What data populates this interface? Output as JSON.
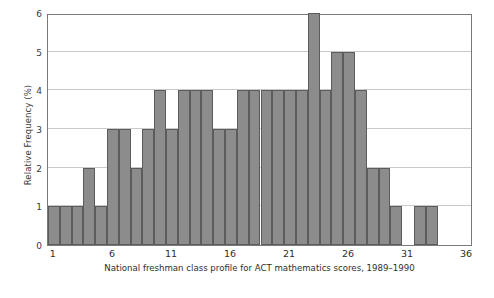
{
  "chart_data": {
    "type": "bar",
    "title": "",
    "caption": "National freshman class profile for ACT mathematics scores, 1989–1990",
    "xlabel": "",
    "ylabel": "Relative Frequency (%)",
    "xlim": [
      0.5,
      36.5
    ],
    "ylim": [
      0,
      6
    ],
    "yticks": [
      0,
      1,
      2,
      3,
      4,
      5,
      6
    ],
    "ytick_labels": [
      "0",
      "1",
      "2",
      "3",
      "4",
      "5",
      "6"
    ],
    "xticks": [
      1,
      6,
      11,
      16,
      21,
      26,
      31,
      36
    ],
    "xtick_labels": [
      "1",
      "6",
      "11",
      "16",
      "21",
      "26",
      "31",
      "36"
    ],
    "grid": "horizontal",
    "legend": null,
    "bar_color": "#8c8c8c",
    "bar_edge_color": "#5c5c5c",
    "frame_color": "#7a7a7a",
    "gridline_color": "#c9c9c9",
    "background": "#ffffff",
    "categories": [
      1,
      2,
      3,
      4,
      5,
      6,
      7,
      8,
      9,
      10,
      11,
      12,
      13,
      14,
      15,
      16,
      17,
      18,
      19,
      20,
      21,
      22,
      23,
      24,
      25,
      26,
      27,
      28,
      29,
      30,
      32,
      33
    ],
    "values": [
      1,
      1,
      1,
      2,
      1,
      3,
      3,
      2,
      3,
      4,
      3,
      4,
      4,
      4,
      3,
      3,
      4,
      4,
      4,
      4,
      4,
      4,
      6,
      4,
      5,
      5,
      4,
      2,
      2,
      1,
      1,
      1
    ],
    "bars": [
      {
        "score": 1,
        "value": 1
      },
      {
        "score": 2,
        "value": 1
      },
      {
        "score": 3,
        "value": 1
      },
      {
        "score": 4,
        "value": 2
      },
      {
        "score": 5,
        "value": 1
      },
      {
        "score": 6,
        "value": 3
      },
      {
        "score": 7,
        "value": 3
      },
      {
        "score": 8,
        "value": 2
      },
      {
        "score": 9,
        "value": 3
      },
      {
        "score": 10,
        "value": 4
      },
      {
        "score": 11,
        "value": 3
      },
      {
        "score": 12,
        "value": 4
      },
      {
        "score": 13,
        "value": 4
      },
      {
        "score": 14,
        "value": 4
      },
      {
        "score": 15,
        "value": 3
      },
      {
        "score": 16,
        "value": 3
      },
      {
        "score": 17,
        "value": 4
      },
      {
        "score": 18,
        "value": 4
      },
      {
        "score": 19,
        "value": 4
      },
      {
        "score": 20,
        "value": 4
      },
      {
        "score": 21,
        "value": 4
      },
      {
        "score": 22,
        "value": 4
      },
      {
        "score": 23,
        "value": 6
      },
      {
        "score": 24,
        "value": 4
      },
      {
        "score": 25,
        "value": 5
      },
      {
        "score": 26,
        "value": 5
      },
      {
        "score": 27,
        "value": 4
      },
      {
        "score": 28,
        "value": 2
      },
      {
        "score": 29,
        "value": 2
      },
      {
        "score": 30,
        "value": 1
      },
      {
        "score": 32,
        "value": 1
      },
      {
        "score": 33,
        "value": 1
      }
    ]
  }
}
